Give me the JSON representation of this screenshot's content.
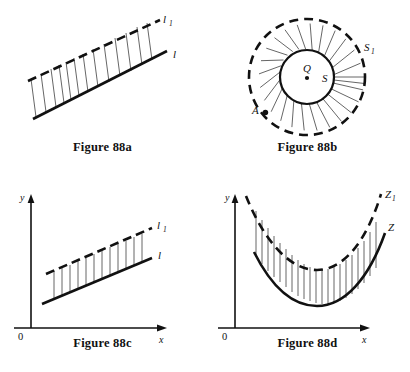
{
  "figures": [
    {
      "id": "88a",
      "caption": "Figure 88a",
      "labels": {
        "dashed_line": "l",
        "dashed_line_sub": "1",
        "solid_line": "l"
      },
      "description": "Two parallel straight lines: a solid line l and a dashed line l1 above it, joined by vertical connecting segments."
    },
    {
      "id": "88b",
      "caption": "Figure 88b",
      "labels": {
        "outer_circle": "S",
        "outer_circle_sub": "1",
        "inner_circle": "S",
        "center_point": "Q",
        "boundary_point": "A"
      },
      "description": "A solid inner circle S with center Q and a dashed outer circle S1, joined by radial segments; point A marked on the outer dashed circle."
    },
    {
      "id": "88c",
      "caption": "Figure 88c",
      "labels": {
        "y_axis": "y",
        "x_axis": "x",
        "origin": "0",
        "dashed_line": "l",
        "dashed_line_sub": "1",
        "solid_line": "l"
      },
      "description": "Coordinate axes with a solid line l and a parallel dashed line l1 above it, joined by vertical segments."
    },
    {
      "id": "88d",
      "caption": "Figure 88d",
      "labels": {
        "y_axis": "y",
        "x_axis": "x",
        "origin": "0",
        "dashed_curve": "Z",
        "dashed_curve_sub": "1",
        "solid_curve": "Z"
      },
      "description": "Coordinate axes with a solid parabola-like curve Z and a dashed curve Z1 above it, joined by vertical segments."
    }
  ],
  "colors": {
    "ink": "#111111",
    "hairline": "#555555",
    "background": "#ffffff"
  }
}
